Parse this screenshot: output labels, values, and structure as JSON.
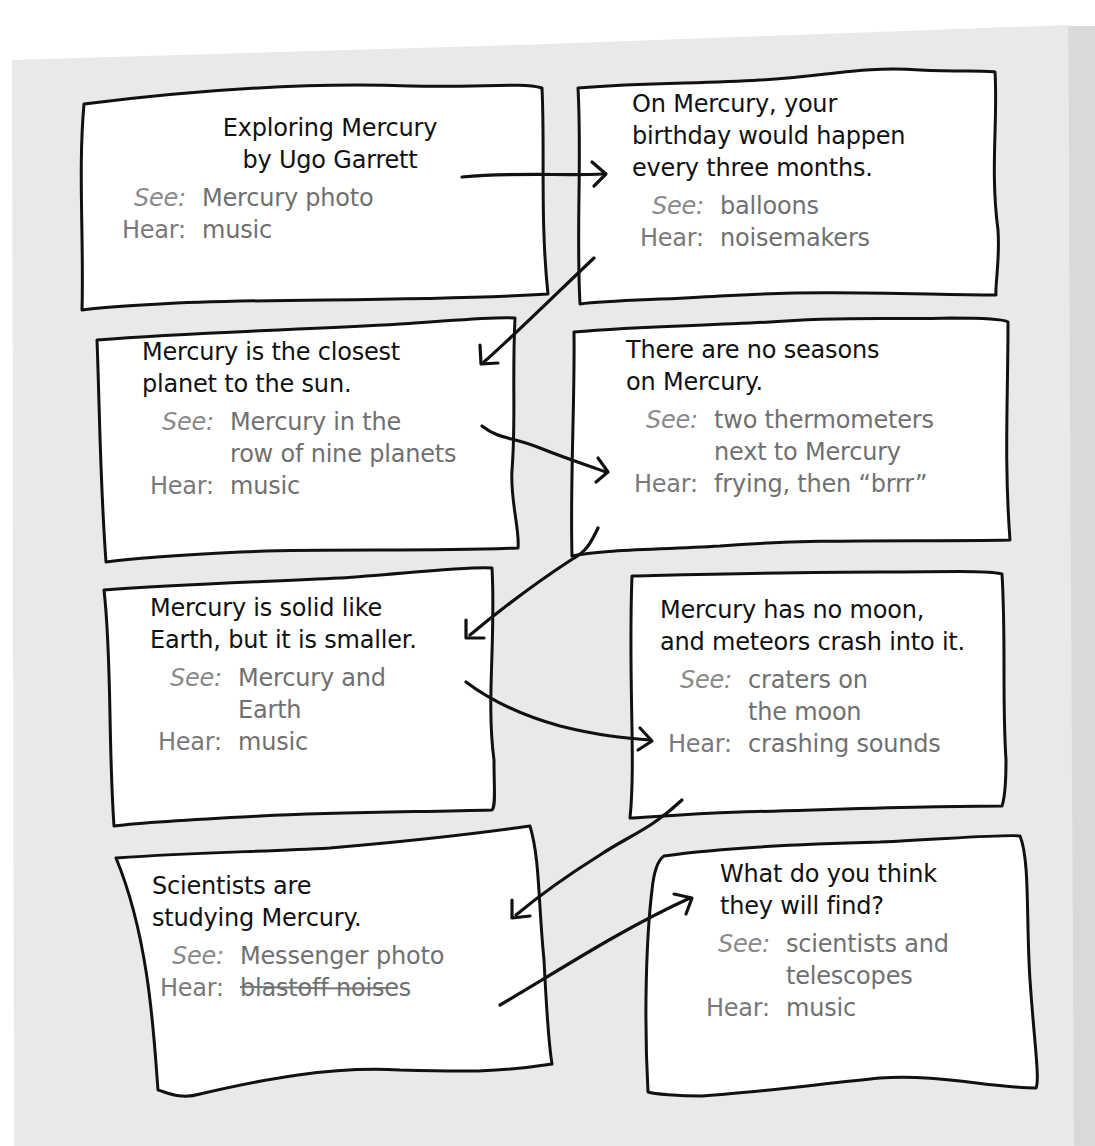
{
  "storyboard": {
    "labels": {
      "see": "See:",
      "hear": "Hear:"
    },
    "colors": {
      "paper": "#e9e9e9",
      "card": "#ffffff",
      "outline": "#111111",
      "title_text": "#111111",
      "detail_text": "#707070"
    },
    "cards": [
      {
        "title": "Exploring Mercury\nby Ugo Garrett",
        "see": "Mercury photo",
        "hear": "music"
      },
      {
        "title": "On Mercury, your\nbirthday would happen\nevery three months.",
        "see": "balloons",
        "hear": "noisemakers"
      },
      {
        "title": "Mercury is the closest\nplanet to the sun.",
        "see": "Mercury in the\nrow of nine planets",
        "hear": "music"
      },
      {
        "title": "There are no seasons\non Mercury.",
        "see": "two thermometers\nnext to Mercury",
        "hear": "frying, then “brrr”"
      },
      {
        "title": "Mercury is solid like\nEarth, but it is smaller.",
        "see": "Mercury and\nEarth",
        "hear": "music"
      },
      {
        "title": "Mercury has no moon,\nand meteors crash into it.",
        "see": "craters on\nthe moon",
        "hear": "crashing sounds"
      },
      {
        "title": "Scientists are\nstudying Mercury.",
        "see_underlined": "Messenger",
        "see": " photo",
        "hear": "blastoff noises"
      },
      {
        "title": "What do you think\nthey will find?",
        "see": "scientists and\ntelescopes",
        "hear": "music"
      }
    ],
    "arrows": [
      {
        "from": 1,
        "to": 2,
        "icon": "arrow-right-icon"
      },
      {
        "from": 2,
        "to": 3,
        "icon": "arrow-down-left-icon"
      },
      {
        "from": 3,
        "to": 4,
        "icon": "arrow-right-icon"
      },
      {
        "from": 4,
        "to": 5,
        "icon": "arrow-down-left-icon"
      },
      {
        "from": 5,
        "to": 6,
        "icon": "arrow-right-icon"
      },
      {
        "from": 6,
        "to": 7,
        "icon": "arrow-down-left-icon"
      },
      {
        "from": 7,
        "to": 8,
        "icon": "arrow-up-right-icon"
      }
    ]
  }
}
